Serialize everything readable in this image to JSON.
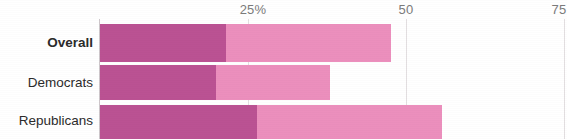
{
  "chart_data": {
    "type": "bar",
    "title": "",
    "subtitle": "",
    "xlabel": "",
    "ylabel": "",
    "orientation": "horizontal",
    "stacked": true,
    "grid": true,
    "legend_position": "none",
    "xlim": [
      0,
      75
    ],
    "xticks": [
      25,
      50,
      75
    ],
    "xtick_labels": [
      "25%",
      "50",
      "75"
    ],
    "categories": [
      "Overall",
      "Democrats",
      "Republicans"
    ],
    "series": [
      {
        "name": "dark",
        "color": "#bb5293",
        "values": [
          20.6,
          18.9,
          25.6
        ]
      },
      {
        "name": "light",
        "color": "#ec8fbd",
        "values": [
          26.9,
          18.7,
          30.3
        ]
      }
    ],
    "totals": [
      47.5,
      37.6,
      55.9
    ]
  },
  "axis": {
    "ticks": [
      {
        "label": "25%",
        "value": 25
      },
      {
        "label": "50",
        "value": 50
      },
      {
        "label": "75",
        "value": 75
      }
    ]
  },
  "rows": [
    {
      "label": "Overall",
      "dark": 20.6,
      "light": 26.9,
      "total": 47.5,
      "emphasis": true
    },
    {
      "label": "Democrats",
      "dark": 18.9,
      "light": 18.7,
      "total": 37.6,
      "emphasis": false
    },
    {
      "label": "Republicans",
      "dark": 25.6,
      "light": 30.3,
      "total": 55.9,
      "emphasis": false
    }
  ],
  "colors": {
    "dark_segment": "#bb5293",
    "light_segment": "#ec8fbd",
    "tick_text": "#7b7b7b",
    "label_text": "#2b2b2b",
    "gridline": "#e3dfe1",
    "axis_line": "#cdc6ca",
    "background": "#ffffff"
  }
}
